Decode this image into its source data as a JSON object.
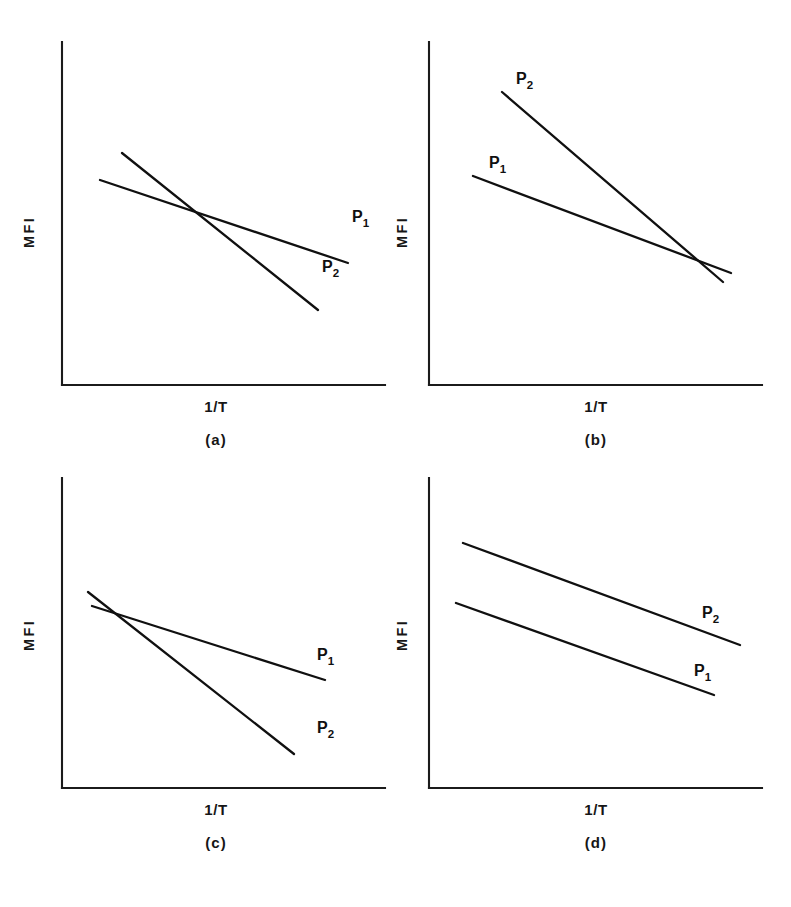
{
  "figure": {
    "axis_label_x": "1/T",
    "axis_label_y": "MFI",
    "series_base": "P",
    "series_sub_1": "1",
    "series_sub_2": "2",
    "line_color": "#101010",
    "axis_color": "#1b1b1b",
    "background_color": "#ffffff",
    "bottom_edge_text": ""
  },
  "panels": [
    {
      "caption": "(a)",
      "label_p1": "P",
      "label_p1_sub": "1",
      "label_p2": "P",
      "label_p2_sub": "2",
      "description": "P1 shallow and P2 steep intersect near the middle of the plot"
    },
    {
      "caption": "(b)",
      "label_p1": "P",
      "label_p1_sub": "1",
      "label_p2": "P",
      "label_p2_sub": "2",
      "description": "P2 starts high with a steep slope and meets the shallow P1 near the right edge"
    },
    {
      "caption": "(c)",
      "label_p1": "P",
      "label_p1_sub": "1",
      "label_p2": "P",
      "label_p2_sub": "2",
      "description": "P1 and P2 intersect near the left edge, P2 falling steeply below P1"
    },
    {
      "caption": "(d)",
      "label_p1": "P",
      "label_p1_sub": "1",
      "label_p2": "P",
      "label_p2_sub": "2",
      "description": "Two parallel lines with no intersection, P2 above P1"
    }
  ],
  "chart_data": [
    {
      "type": "line",
      "title": "(a)",
      "xlabel": "1/T",
      "ylabel": "MFI",
      "xlim": [
        0,
        100
      ],
      "ylim": [
        0,
        100
      ],
      "grid": false,
      "legend": "inline-end-labels",
      "axes": {
        "left": 62,
        "bottom": 385,
        "right": 385,
        "top": 42
      },
      "series": [
        {
          "name": "P1",
          "label_x": 352,
          "label_y": 222,
          "points": [
            [
              100,
              180
            ],
            [
              348,
              263
            ]
          ],
          "slope_class": "shallow"
        },
        {
          "name": "P2",
          "label_x": 322,
          "label_y": 272,
          "points": [
            [
              122,
              153
            ],
            [
              318,
              310
            ]
          ],
          "slope_class": "steep"
        }
      ],
      "intersection": [
        230,
        225
      ]
    },
    {
      "type": "line",
      "title": "(b)",
      "xlabel": "1/T",
      "ylabel": "MFI",
      "xlim": [
        0,
        100
      ],
      "ylim": [
        0,
        100
      ],
      "grid": false,
      "legend": "inline-start-labels",
      "axes": {
        "left": 429,
        "bottom": 385,
        "right": 762,
        "top": 42
      },
      "series": [
        {
          "name": "P1",
          "label_x": 489,
          "label_y": 168,
          "points": [
            [
              473,
              176
            ],
            [
              731,
              273
            ]
          ],
          "slope_class": "shallow"
        },
        {
          "name": "P2",
          "label_x": 516,
          "label_y": 84,
          "points": [
            [
              502,
              92
            ],
            [
              723,
              282
            ]
          ],
          "slope_class": "steep"
        }
      ],
      "intersection": [
        702,
        265
      ]
    },
    {
      "type": "line",
      "title": "(c)",
      "xlabel": "1/T",
      "ylabel": "MFI",
      "xlim": [
        0,
        100
      ],
      "ylim": [
        0,
        100
      ],
      "grid": false,
      "legend": "inline-end-labels",
      "axes": {
        "left": 62,
        "bottom": 788,
        "right": 385,
        "top": 478
      },
      "series": [
        {
          "name": "P1",
          "label_x": 317,
          "label_y": 660,
          "points": [
            [
              92,
              606
            ],
            [
              325,
              680
            ]
          ],
          "slope_class": "shallow"
        },
        {
          "name": "P2",
          "label_x": 317,
          "label_y": 733,
          "points": [
            [
              88,
              592
            ],
            [
              294,
              754
            ]
          ],
          "slope_class": "steep"
        }
      ],
      "intersection": [
        125,
        617
      ]
    },
    {
      "type": "line",
      "title": "(d)",
      "xlabel": "1/T",
      "ylabel": "MFI",
      "xlim": [
        0,
        100
      ],
      "ylim": [
        0,
        100
      ],
      "grid": false,
      "legend": "inline-end-labels",
      "axes": {
        "left": 429,
        "bottom": 788,
        "right": 762,
        "top": 478
      },
      "series": [
        {
          "name": "P1",
          "label_x": 694,
          "label_y": 676,
          "points": [
            [
              456,
              603
            ],
            [
              714,
              695
            ]
          ],
          "slope_class": "parallel-lower"
        },
        {
          "name": "P2",
          "label_x": 702,
          "label_y": 618,
          "points": [
            [
              463,
              543
            ],
            [
              740,
              645
            ]
          ],
          "slope_class": "parallel-upper"
        }
      ],
      "intersection": null
    }
  ]
}
